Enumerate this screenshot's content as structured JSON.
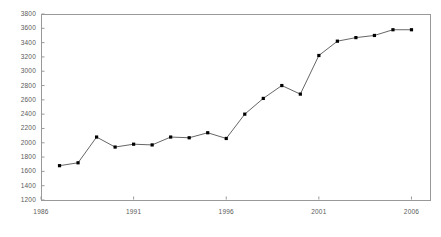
{
  "chart_data": {
    "type": "line",
    "title": "",
    "subtitle": "",
    "xlabel": "",
    "ylabel": "",
    "grid": false,
    "legend": null,
    "marker": "filled-square",
    "line_color": "#555555",
    "marker_color": "#000000",
    "axis_color": "#999999",
    "xlim": [
      1986,
      2007
    ],
    "ylim": [
      1200,
      3800
    ],
    "xticks": [
      1986,
      1991,
      1996,
      2001,
      2006
    ],
    "xtick_labels": [
      "1986",
      "1991",
      "1996",
      "2001",
      "2006"
    ],
    "yticks": [
      1200,
      1400,
      1600,
      1800,
      2000,
      2200,
      2400,
      2600,
      2800,
      3000,
      3200,
      3400,
      3600,
      3800
    ],
    "ytick_labels": [
      "1200",
      "1400",
      "1600",
      "1800",
      "2000",
      "2200",
      "2400",
      "2600",
      "2800",
      "3000",
      "3200",
      "3400",
      "3600",
      "3800"
    ],
    "x": [
      1987,
      1988,
      1989,
      1990,
      1991,
      1992,
      1993,
      1994,
      1995,
      1996,
      1997,
      1998,
      1999,
      2000,
      2001,
      2002,
      2003,
      2004,
      2005,
      2006
    ],
    "values": [
      1680,
      1720,
      2080,
      1940,
      1980,
      1970,
      2080,
      2070,
      2140,
      2060,
      2400,
      2620,
      2800,
      2680,
      3220,
      3420,
      3470,
      3500,
      3580,
      3580
    ]
  }
}
